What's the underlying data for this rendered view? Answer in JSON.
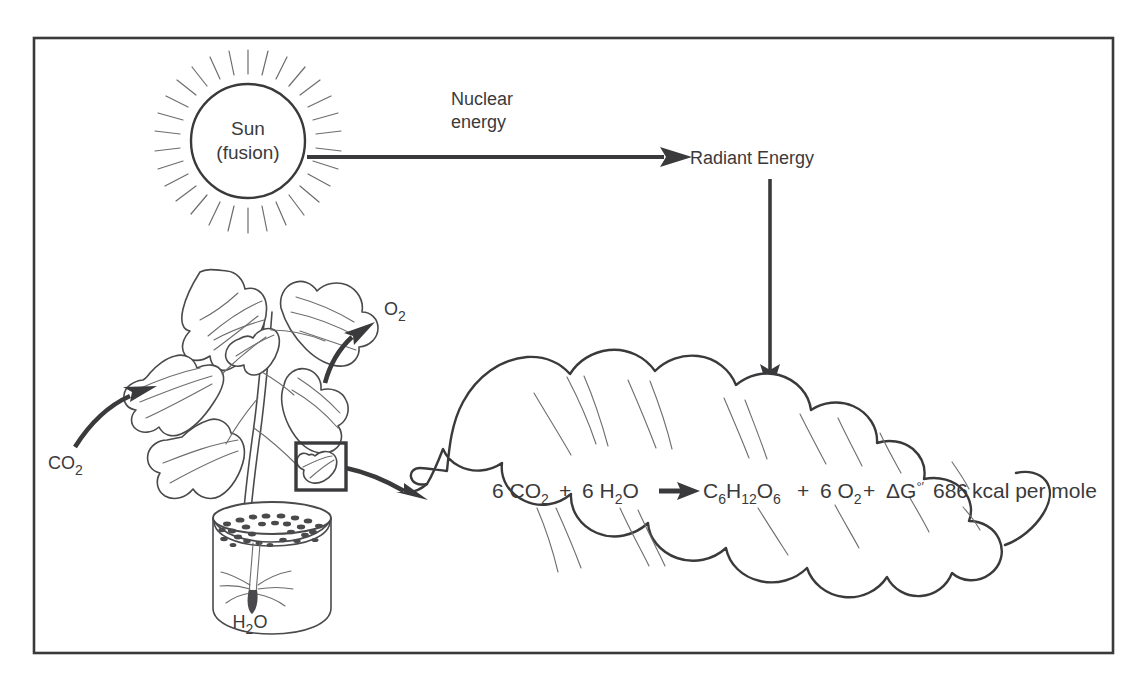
{
  "figure": {
    "frame_color": "#3a3a3c",
    "background": "#ffffff",
    "ink_color": "#3a3a3c"
  },
  "labels": {
    "sun_line1": "Sun",
    "sun_line2": "(fusion)",
    "nuclear_line1": "Nuclear",
    "nuclear_line2": "energy",
    "radiant_energy": "Radiant Energy",
    "chlorophyll": "Chlorophyll",
    "carbon_dioxide": "CO",
    "carbon_dioxide_sub": "2",
    "oxygen": "O",
    "oxygen_sub": "2",
    "water": "H",
    "water_sub": "2",
    "water_tail": "O"
  },
  "equation": {
    "full_text": "6 CO2 + 6 H2O → C6H12O6 + 6 O2 + ΔG°′ 686 kcal per mole",
    "reactant_co2_coef": "6 CO",
    "reactant_co2_sub": "2",
    "plus_1": "+",
    "reactant_h2o_coef": "6 H",
    "reactant_h2o_sub": "2",
    "reactant_h2o_tail": "O",
    "product_glucose_c": "C",
    "product_glucose_c_sub": "6",
    "product_glucose_h": "H",
    "product_glucose_h_sub": "12",
    "product_glucose_o": "O",
    "product_glucose_o_sub": "6",
    "plus_2": "+",
    "product_o2_coef": "6 O",
    "product_o2_sub": "2",
    "plus_3": "+",
    "delta_g": "ΔG",
    "delta_g_superscript": "°′",
    "energy_value": "686",
    "energy_units": "kcal per mole"
  },
  "arrows": [
    {
      "name": "sun-to-radiant-energy",
      "label": "Nuclear energy",
      "from": "Sun (fusion)",
      "to": "Radiant Energy",
      "direction": "right"
    },
    {
      "name": "radiant-energy-to-chlorophyll",
      "from": "Radiant Energy",
      "to": "Chlorophyll",
      "direction": "down"
    },
    {
      "name": "chlorophyll-to-reaction",
      "from": "Chlorophyll",
      "to": "reaction arrow",
      "direction": "down-right"
    },
    {
      "name": "co2-uptake",
      "from": "CO2",
      "to": "plant leaves",
      "direction": "up-right"
    },
    {
      "name": "o2-release",
      "from": "plant leaves",
      "to": "O2",
      "direction": "up-right"
    },
    {
      "name": "leaf-magnification",
      "from": "leaf detail box",
      "to": "magnified leaf",
      "direction": "right"
    },
    {
      "name": "reaction-arrow",
      "from": "reactants",
      "to": "products",
      "direction": "right"
    }
  ],
  "objects": [
    {
      "name": "sun",
      "kind": "circle-with-rays"
    },
    {
      "name": "plant",
      "kind": "potted-seedling"
    },
    {
      "name": "beaker",
      "kind": "cylinder-with-soil-and-roots"
    },
    {
      "name": "magnified-leaf",
      "kind": "cloud-like-leaf-outline"
    },
    {
      "name": "leaf-detail-box",
      "kind": "rectangle-highlight"
    }
  ]
}
